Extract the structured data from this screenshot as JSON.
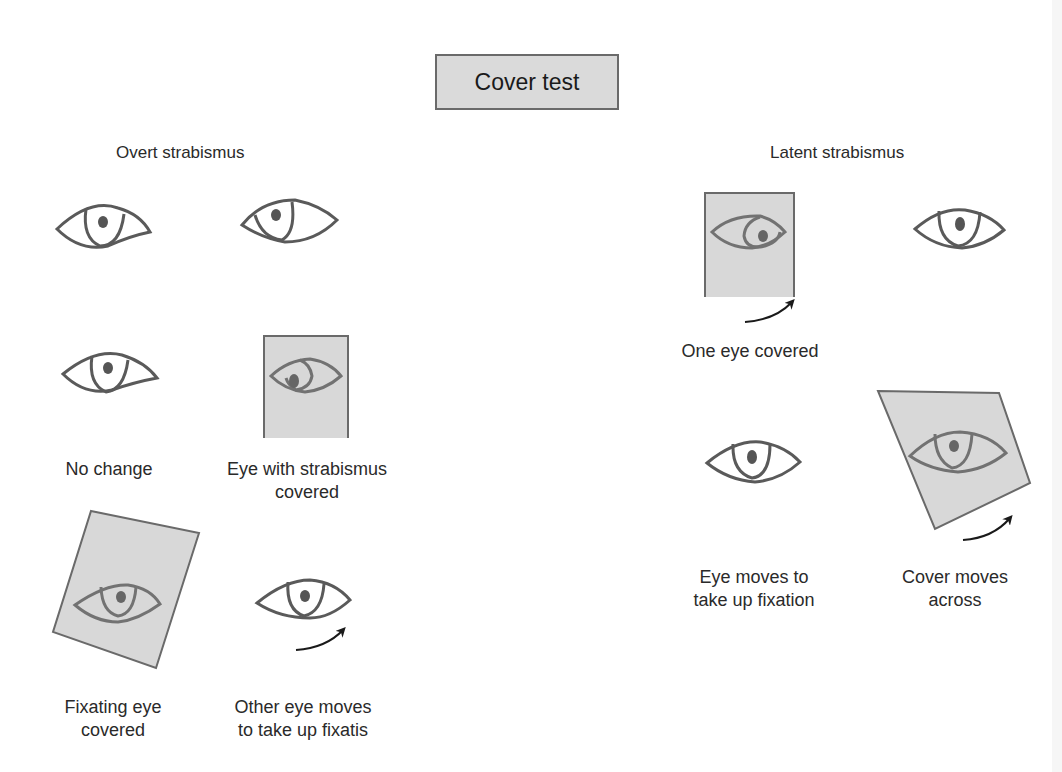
{
  "title": "Cover test",
  "sections": {
    "overt": {
      "heading": "Overt strabismus",
      "captions": {
        "no_change": "No change",
        "strab_covered_1": "Eye with strabismus",
        "strab_covered_2": "covered",
        "fixating_covered_1": "Fixating eye",
        "fixating_covered_2": "covered",
        "other_moves_1": "Other eye moves",
        "other_moves_2": "to take up fixatis"
      }
    },
    "latent": {
      "heading": "Latent strabismus",
      "captions": {
        "one_eye_covered": "One eye covered",
        "eye_moves_1": "Eye moves to",
        "eye_moves_2": "take up fixation",
        "cover_moves_1": "Cover moves",
        "cover_moves_2": "across"
      }
    }
  },
  "colors": {
    "eye_stroke": "#5a5a5a",
    "pupil": "#555555",
    "cover_fill": "#d8d8d8",
    "cover_stroke": "#6a6a6a",
    "arrow": "#1a1a1a",
    "title_fill": "#dadada"
  }
}
